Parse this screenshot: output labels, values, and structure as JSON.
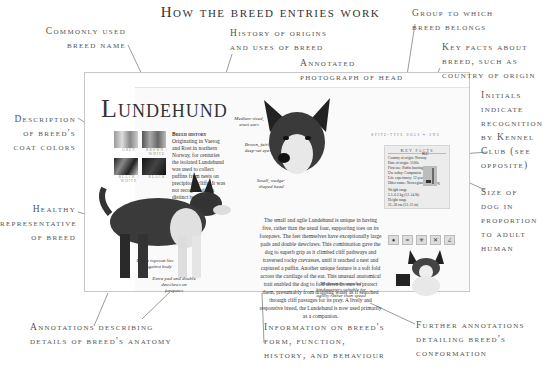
{
  "title": "How the breed entries work",
  "callouts": {
    "common_name": [
      "Commonly used",
      "breed name"
    ],
    "history": [
      "History of origins",
      "and uses of breed"
    ],
    "photo_head": [
      "Annotated",
      "photograph of head"
    ],
    "group": [
      "Group to which",
      "breed belongs"
    ],
    "key_facts": [
      "Key facts about",
      "breed, such as",
      "country of origin"
    ],
    "initials": [
      "Initials",
      "indicate",
      "recognition",
      "by Kennel",
      "Club (see",
      "opposite)"
    ],
    "size": [
      "Size of",
      "dog in",
      "proportion",
      "to adult",
      "human"
    ],
    "coat": [
      "Description",
      "of breed's",
      "coat colors"
    ],
    "healthy": [
      "Healthy",
      "representative",
      "of breed"
    ],
    "anatomy": [
      "Annotations describing",
      "details of  breed's anatomy"
    ],
    "info": [
      "Information on breed's",
      "form, function,",
      "history, and behaviour"
    ],
    "further": [
      "Further annotations",
      "detailing breed's",
      "conformation"
    ]
  },
  "page": {
    "breed_name": "Lundehund",
    "group_line": "Spitz-type dogs",
    "page_number": "195",
    "coat_colors": [
      "Grey",
      "Brown / White",
      "Black / White",
      "Black"
    ],
    "history_label": "Breed history",
    "history_text": "Originating in Vaerog and Rost in northern Norway, for centuries the isolated Lundehund was used to collect puffins from nests on precipitous cliffs. It was not recognized as a distinct breed until 1943.",
    "head_annotations": [
      "Medium-sized, erect ears",
      "Brown, fairly deep-set eyes",
      "Small, wedge-shaped head"
    ],
    "body_annotations": [
      "Dense topcoat lies flat against body",
      "Extra pad and double dewclaws on forepaws",
      "Moderately muscled hindquarters suitable for agility rather than speed"
    ],
    "key_facts": {
      "title": "Key facts",
      "lines": [
        "Country of origin: Norway",
        "Date of origin: 1500s",
        "First use: Puffin hunting",
        "Use today: Companion",
        "Life expectancy: 12 years",
        "Other name: Norwegian Puffin Dog"
      ],
      "weight_label": "Weight range",
      "weight": "5.5–6.5 kg (12–14 lb)",
      "height_label": "Height range",
      "height": "31–38 cm (12–15 in)"
    },
    "kc_initials": "KC",
    "main_text": "The small and agile Lundehund is unique in having five, rather than the usual four, supporting toes on its forepaws. The feet themselves have exceptionally large pads and double dewclaws. This combination gave the dog to superb grip as it climbed cliff pathways and traversed rocky crevasses, until it reached a nest and captured a puffin. Another unique feature is a soft fold across the cartilage of the ear. This unusual anatomical trait enabled the dog to fold down its ears to protect them, presumably from dripping water as it searched through cliff passages for its prey. A lively and responsive breed, the Lundehund is now used primarily as a companion."
  }
}
